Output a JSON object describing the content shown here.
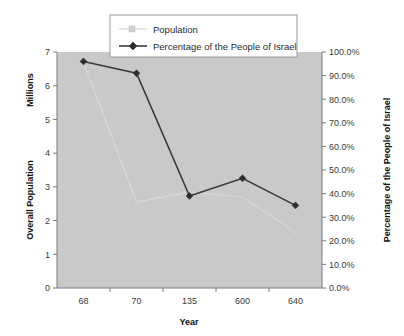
{
  "chart_data": {
    "type": "line",
    "title": "",
    "xlabel": "Year",
    "categories": [
      "68",
      "70",
      "135",
      "600",
      "640"
    ],
    "grid": false,
    "legend_position": "top-center",
    "plot_background": "#c9c9c9",
    "series": [
      {
        "name": "Population",
        "axis": "left",
        "color": "#d0d0d0",
        "marker": "square",
        "values": [
          6.7,
          2.55,
          2.85,
          2.7,
          1.65
        ]
      },
      {
        "name": "Percentage of the People of Israel",
        "axis": "right",
        "color": "#2e2e2e",
        "marker": "diamond",
        "values": [
          96.0,
          91.0,
          39.0,
          46.5,
          35.0
        ]
      }
    ],
    "left_axis": {
      "label": "Overall Population",
      "unit_label": "Millions",
      "ylim": [
        0,
        7
      ],
      "ticks": [
        0,
        1,
        2,
        3,
        4,
        5,
        6,
        7
      ],
      "tick_labels": [
        "0",
        "1",
        "2",
        "3",
        "4",
        "5",
        "6",
        "7"
      ]
    },
    "right_axis": {
      "label": "Percentage of the People of Israel",
      "ylim": [
        0,
        100
      ],
      "ticks": [
        0,
        10,
        20,
        30,
        40,
        50,
        60,
        70,
        80,
        90,
        100
      ],
      "tick_labels": [
        "0.0%",
        "10.0%",
        "20.0%",
        "30.0%",
        "40.0%",
        "50.0%",
        "60.0%",
        "70.0%",
        "80.0%",
        "90.0%",
        "100.0%"
      ]
    },
    "legend": [
      {
        "label": "Population",
        "color": "#d0d0d0",
        "marker": "square"
      },
      {
        "label": "Percentage of the People of Israel",
        "color": "#2e2e2e",
        "marker": "diamond"
      }
    ]
  }
}
